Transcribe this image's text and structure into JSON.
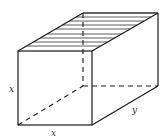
{
  "diagram": {
    "type": "rectangular box (prism) with hatched top face",
    "labels": {
      "left_height": "x",
      "bottom_width": "x",
      "depth": "y"
    },
    "vertices": {
      "front_top_left": [
        18,
        51
      ],
      "front_top_right": [
        92,
        51
      ],
      "front_bottom_left": [
        18,
        125
      ],
      "front_bottom_right": [
        92,
        125
      ],
      "back_top_left": [
        83,
        13
      ],
      "back_top_right": [
        158,
        13
      ],
      "back_bottom_left": [
        83,
        86
      ],
      "back_bottom_right": [
        158,
        86
      ]
    },
    "hatch_count": 10,
    "colors": {
      "line": "#1a1a1a",
      "background": "#ffffff"
    }
  }
}
